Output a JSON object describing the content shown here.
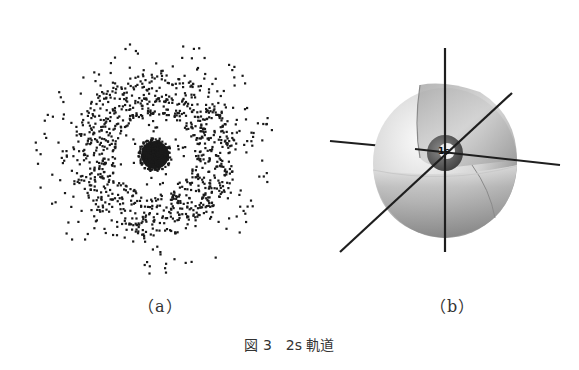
{
  "figure": {
    "number_label": "図 3",
    "title": "2s 軌道",
    "panels": [
      {
        "id": "a",
        "label": "（a）",
        "description": "2s orbital electron probability point cloud: dense core, nodal gap, outer dense shell, sparse halo"
      },
      {
        "id": "b",
        "label": "（b）",
        "description": "2s orbital boundary sphere with a quarter cut away, inner 1s-like sphere at origin, three coordinate axes",
        "center_label": "1s"
      }
    ]
  },
  "colors": {
    "dot": "#1a1a1a",
    "axis": "#1e1e1e",
    "sphere_light": "#f4f4f4",
    "sphere_mid": "#b5b5b5",
    "sphere_dark": "#7a7a7a",
    "inner_sphere": "#4a4a4a",
    "text": "#333333"
  },
  "point_cloud": {
    "center": [
      125,
      125
    ],
    "core_radius": 14,
    "core_count": 220,
    "node_inner": 22,
    "node_outer": 40,
    "shell_inner": 40,
    "shell_outer": 82,
    "shell_count": 900,
    "halo_inner": 82,
    "halo_outer": 120,
    "halo_count": 170,
    "dot_size": 2.2
  }
}
